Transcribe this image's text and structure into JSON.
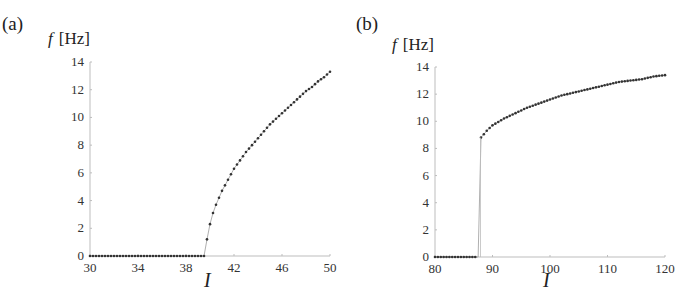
{
  "chart_data": [
    {
      "panel": "(a)",
      "type": "scatter",
      "title": "",
      "xlabel": "I",
      "ylabel": "f [Hz]",
      "xlim": [
        30,
        50
      ],
      "ylim": [
        0,
        14
      ],
      "xticks": [
        30,
        34,
        38,
        42,
        46,
        50
      ],
      "yticks": [
        0,
        2,
        4,
        6,
        8,
        10,
        12,
        14
      ],
      "grid": false,
      "legend": null,
      "description": "Continuous onset: f = 0 for I < ~39.7, then rises as a square-root-like curve to ~13.3 Hz at I = 50",
      "series": [
        {
          "name": "firing rate",
          "x": [
            30,
            31,
            32,
            33,
            34,
            35,
            36,
            37,
            38,
            39,
            39.5,
            39.75,
            40,
            40.25,
            40.5,
            40.75,
            41,
            41.5,
            42,
            42.5,
            43,
            43.5,
            44,
            44.5,
            45,
            45.5,
            46,
            46.5,
            47,
            47.5,
            48,
            48.5,
            49,
            49.5,
            50
          ],
          "y": [
            0,
            0,
            0,
            0,
            0,
            0,
            0,
            0,
            0,
            0,
            0,
            1.2,
            2.3,
            3.1,
            3.7,
            4.2,
            4.7,
            5.5,
            6.3,
            6.9,
            7.5,
            8.0,
            8.5,
            9.0,
            9.5,
            9.9,
            10.3,
            10.7,
            11.1,
            11.5,
            11.9,
            12.2,
            12.6,
            12.9,
            13.3
          ]
        }
      ]
    },
    {
      "panel": "(b)",
      "type": "scatter",
      "title": "",
      "xlabel": "I",
      "ylabel": "f [Hz]",
      "xlim": [
        80,
        120
      ],
      "ylim": [
        0,
        14
      ],
      "xticks": [
        80,
        90,
        100,
        110,
        120
      ],
      "yticks": [
        0,
        2,
        4,
        6,
        8,
        10,
        12,
        14
      ],
      "grid": false,
      "legend": null,
      "description": "Discontinuous onset: f = 0 for I < ~87.8, then jumps to ~8.8 Hz and rises slowly to ~13.4 Hz at I = 120",
      "series": [
        {
          "name": "firing rate",
          "x": [
            80,
            81,
            82,
            83,
            84,
            85,
            86,
            87,
            87.5,
            88,
            89,
            90,
            92,
            94,
            96,
            98,
            100,
            102,
            104,
            106,
            108,
            110,
            112,
            114,
            116,
            118,
            120
          ],
          "y": [
            0,
            0,
            0,
            0,
            0,
            0,
            0,
            0,
            0,
            8.8,
            9.3,
            9.7,
            10.2,
            10.6,
            11.0,
            11.3,
            11.6,
            11.9,
            12.1,
            12.3,
            12.5,
            12.7,
            12.9,
            13.0,
            13.1,
            13.3,
            13.4
          ]
        }
      ]
    }
  ],
  "labels": {
    "panel_a": "(a)",
    "panel_b": "(b)",
    "ylabel_a_var": "f",
    "ylabel_a_unit": "[Hz]",
    "ylabel_b_var": "f",
    "ylabel_b_unit": "[Hz]",
    "xlabel_a": "I",
    "xlabel_b": "I"
  },
  "colors": {
    "axis": "#bdbdbd",
    "marker": "#333333",
    "line": "#9a9a9a",
    "text": "#222222"
  }
}
